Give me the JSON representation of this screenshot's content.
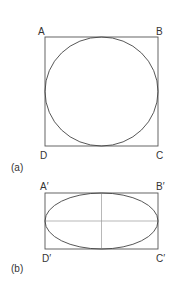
{
  "figure_a": {
    "caption": "(a)",
    "labels": {
      "A": "A",
      "B": "B",
      "C": "C",
      "D": "D"
    },
    "shape": "circle inscribed in square"
  },
  "figure_b": {
    "caption": "(b)",
    "labels": {
      "A": "A′",
      "B": "B′",
      "C": "C′",
      "D": "D′"
    },
    "shape": "ellipse inscribed in rectangle with axes"
  },
  "colors": {
    "line": "#444444",
    "axis": "#999999",
    "text": "#333333"
  }
}
